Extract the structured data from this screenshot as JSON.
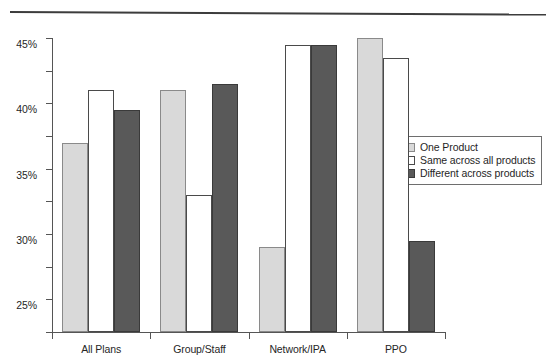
{
  "chart_data": {
    "type": "bar",
    "title": "",
    "subtitle": "",
    "xlabel": "",
    "ylabel": "",
    "categories": [
      "All Plans",
      "Group/Staff",
      "Network/IPA",
      "PPO"
    ],
    "series": [
      {
        "name": "One Product",
        "color": "#d9d9d9",
        "values": [
          29,
          37,
          13,
          45
        ]
      },
      {
        "name": "Same across all products",
        "color": "#ffffff",
        "values": [
          37,
          21,
          44,
          42
        ]
      },
      {
        "name": "Different across products",
        "color": "#595959",
        "values": [
          34,
          38,
          44,
          14
        ]
      }
    ],
    "ylim": [
      0,
      45
    ],
    "ytick_values": [
      0,
      5,
      10,
      15,
      20,
      25,
      30,
      35,
      40,
      45
    ],
    "ytick_labels": [
      "0%",
      "5%",
      "10%",
      "15%",
      "20%",
      "25%",
      "30%",
      "35%",
      "40%",
      "45%"
    ],
    "grid": false,
    "legend_position": "right",
    "value_unit": "%"
  },
  "legend": {
    "items": [
      {
        "label": "One Product",
        "swatch": "light-gray"
      },
      {
        "label": "Same across all products",
        "swatch": "white"
      },
      {
        "label": "Different across products",
        "swatch": "dark-gray"
      }
    ]
  }
}
